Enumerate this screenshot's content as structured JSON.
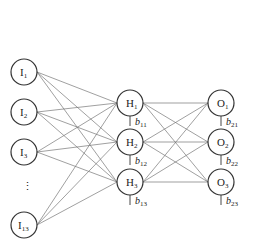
{
  "diagram": {
    "title": "",
    "layers": {
      "input": [
        {
          "id": "I1",
          "base": "I",
          "sub": "1",
          "x": 24,
          "y": 72
        },
        {
          "id": "I2",
          "base": "I",
          "sub": "2",
          "x": 24,
          "y": 112
        },
        {
          "id": "I3",
          "base": "I",
          "sub": "3",
          "x": 24,
          "y": 152
        },
        {
          "id": "I13",
          "base": "I",
          "sub": "13",
          "x": 24,
          "y": 225
        }
      ],
      "ellipsis": {
        "text": "⋮",
        "x": 24,
        "y": 190
      },
      "hidden": [
        {
          "id": "H1",
          "base": "H",
          "sub": "1",
          "x": 130,
          "y": 103,
          "bias_base": "b",
          "bias_sub": "11"
        },
        {
          "id": "H2",
          "base": "H",
          "sub": "2",
          "x": 130,
          "y": 142,
          "bias_base": "b",
          "bias_sub": "12"
        },
        {
          "id": "H3",
          "base": "H",
          "sub": "3",
          "x": 130,
          "y": 182,
          "bias_base": "b",
          "bias_sub": "13"
        }
      ],
      "output": [
        {
          "id": "O1",
          "base": "O",
          "sub": "1",
          "x": 221,
          "y": 103,
          "bias_base": "b",
          "bias_sub": "21"
        },
        {
          "id": "O2",
          "base": "O",
          "sub": "2",
          "x": 221,
          "y": 142,
          "bias_base": "b",
          "bias_sub": "22"
        },
        {
          "id": "O3",
          "base": "O",
          "sub": "3",
          "x": 221,
          "y": 182,
          "bias_base": "b",
          "bias_sub": "23"
        }
      ]
    },
    "radius": 13,
    "connectivity": "fully-connected input→hidden and hidden→output"
  }
}
